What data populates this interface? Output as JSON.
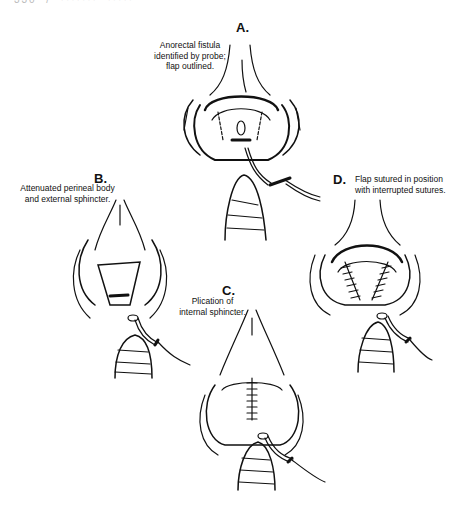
{
  "page": {
    "running_header": "330  /  ·······  ·····"
  },
  "figure": {
    "panels": [
      {
        "letter": "A.",
        "caption_lines": [
          "Anorectal fistula",
          "identified by probe;",
          "flap outlined."
        ]
      },
      {
        "letter": "B.",
        "caption_lines": [
          "Attenuated perineal body",
          "and external sphincter."
        ]
      },
      {
        "letter": "C.",
        "caption_lines": [
          "Plication of",
          "internal sphincter."
        ]
      },
      {
        "letter": "D.",
        "caption_lines": [
          "Flap sutured in position",
          "with interrupted sutures."
        ]
      }
    ]
  },
  "colors": {
    "ink": "#111111",
    "paper": "#ffffff"
  }
}
